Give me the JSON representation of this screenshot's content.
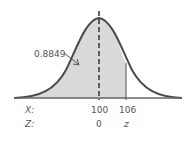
{
  "figure": {
    "type": "normal-distribution-curve",
    "area_label": "0.8849",
    "x_axis_label": "X:",
    "z_axis_label": "Z:",
    "x_ticks": [
      "100",
      "106"
    ],
    "z_ticks": [
      "0",
      "z"
    ],
    "colors": {
      "curve": "#4a4a4a",
      "fill": "#d9d9d9",
      "axis": "#666666",
      "text": "#555555"
    }
  }
}
